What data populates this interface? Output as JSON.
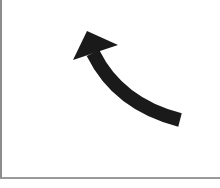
{
  "canvas": {
    "background": "#ffffff",
    "border_color": "#8c8c8c"
  },
  "arrow": {
    "icon": "curved-arrow-up-left-icon",
    "color": "#1a1a1a",
    "direction": "up-left"
  }
}
